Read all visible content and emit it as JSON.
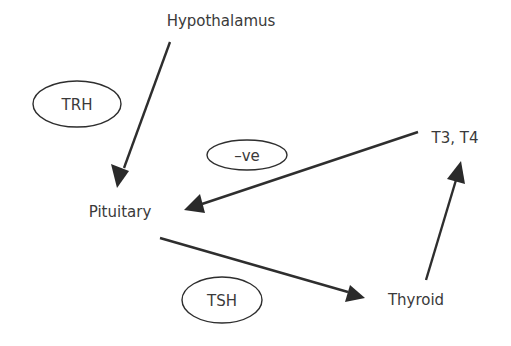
{
  "diagram": {
    "type": "hormone-feedback-loop",
    "nodes": {
      "hypothalamus": {
        "label": "Hypothalamus"
      },
      "pituitary": {
        "label": "Pituitary"
      },
      "thyroid": {
        "label": "Thyroid"
      },
      "t3t4": {
        "label": "T3, T4"
      }
    },
    "edge_labels": {
      "trh": {
        "label": "TRH"
      },
      "negative_feedback": {
        "label": "–ve"
      },
      "tsh": {
        "label": "TSH"
      }
    },
    "edges": [
      {
        "from": "Hypothalamus",
        "to": "Pituitary",
        "label": "TRH"
      },
      {
        "from": "Pituitary",
        "to": "Thyroid",
        "label": "TSH"
      },
      {
        "from": "Thyroid",
        "to": "T3, T4",
        "label": ""
      },
      {
        "from": "T3, T4",
        "to": "Pituitary",
        "label": "–ve"
      }
    ],
    "colors": {
      "line": "#2e2e2e",
      "text": "#3a3a3a",
      "background": "#ffffff"
    }
  }
}
